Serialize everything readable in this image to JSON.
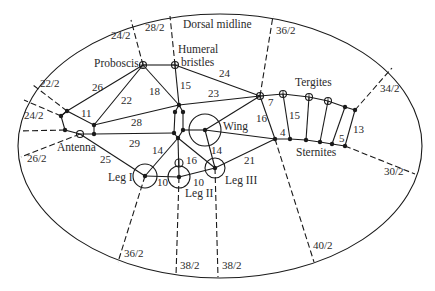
{
  "diagram": {
    "type": "insect body ventral/lateral cut map with sensory nerve fiber counts",
    "colors": {
      "line": "#1a1a1a",
      "text": "#2a2a2a",
      "background": "#ffffff"
    },
    "structures": {
      "dorsal_midline": "Dorsal midline",
      "proboscis": "Proboscis",
      "humeral_line1": "Humeral",
      "humeral_line2": "bristles",
      "wing": "Wing",
      "tergites": "Tergites",
      "sternites": "Sternites",
      "antenna": "Antenna",
      "leg1": "Leg I",
      "leg2": "Leg II",
      "leg3": "Leg III"
    },
    "boundary_counts": {
      "b_24_2_top": "24/2",
      "b_28_2": "28/2",
      "b_36_2_top": "36/2",
      "b_22_2": "22/2",
      "b_24_2_left": "24/2",
      "b_26_2": "26/2",
      "b_34_2": "34/2",
      "b_30_2": "30/2",
      "b_36_2_bottom": "36/2",
      "b_38_2_a": "38/2",
      "b_38_2_b": "38/2",
      "b_40_2": "40/2"
    },
    "edge_counts": {
      "e26": "26",
      "e22": "22",
      "e18": "18",
      "e15a": "15",
      "e24": "24",
      "e23": "23",
      "e11": "11",
      "e28": "28",
      "e29": "29",
      "e25": "25",
      "e14a": "14",
      "e16a": "16",
      "e14b": "14",
      "e10a": "10",
      "e10b": "10",
      "e21": "21",
      "e16b": "16",
      "e7": "7",
      "e15b": "15",
      "e4": "4",
      "e5": "5",
      "e13": "13"
    }
  }
}
